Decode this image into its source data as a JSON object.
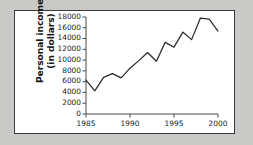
{
  "figure": {
    "background_color": "#c9c9c7",
    "panel_color": "#ffffff",
    "border_color": "#3b3b3b",
    "line_color": "#2a2a2a",
    "axis_color": "#4a4a4a"
  },
  "axis": {
    "ylabel_line1": "Personal income",
    "ylabel_line2": "(in dollars)",
    "yticks": [
      "18000",
      "16000",
      "14000",
      "12000",
      "10000",
      "8000",
      "6000",
      "4000",
      "2000",
      "0"
    ],
    "ytick_values": [
      18000,
      16000,
      14000,
      12000,
      10000,
      8000,
      6000,
      4000,
      2000,
      0
    ],
    "xticks": [
      "1985",
      "1990",
      "1995",
      "2000"
    ],
    "xtick_values": [
      1985,
      1990,
      1995,
      2000
    ]
  },
  "chart_data": {
    "type": "line",
    "title": "",
    "xlabel": "",
    "ylabel": "Personal income (in dollars)",
    "xlim": [
      1985,
      2000
    ],
    "ylim": [
      0,
      18000
    ],
    "grid": false,
    "legend": "none",
    "x": [
      1985,
      1986,
      1987,
      1988,
      1989,
      1990,
      1991,
      1992,
      1993,
      1994,
      1995,
      1996,
      1997,
      1998,
      1999,
      2000
    ],
    "values": [
      6300,
      4300,
      6800,
      7500,
      6700,
      8500,
      9900,
      11400,
      9800,
      13300,
      12400,
      15200,
      13800,
      17800,
      17600,
      15400
    ],
    "series": [
      {
        "name": "Personal income",
        "values": [
          6300,
          4300,
          6800,
          7500,
          6700,
          8500,
          9900,
          11400,
          9800,
          13300,
          12400,
          15200,
          13800,
          17800,
          17600,
          15400
        ]
      }
    ]
  }
}
